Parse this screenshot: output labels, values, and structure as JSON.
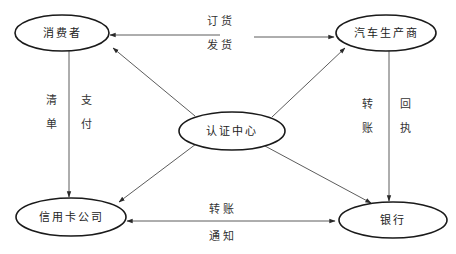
{
  "diagram": {
    "nodes": [
      {
        "id": "consumer",
        "label": "消费者",
        "cx": 62,
        "cy": 33,
        "rx": 47,
        "ry": 18
      },
      {
        "id": "manufacturer",
        "label": "汽车生产商",
        "cx": 386,
        "cy": 33,
        "rx": 50,
        "ry": 18
      },
      {
        "id": "cert_center",
        "label": "认证中心",
        "cx": 232,
        "cy": 131,
        "rx": 53,
        "ry": 19
      },
      {
        "id": "credit_card_co",
        "label": "信用卡公司",
        "cx": 71,
        "cy": 217,
        "rx": 55,
        "ry": 19
      },
      {
        "id": "bank",
        "label": "银行",
        "cx": 393,
        "cy": 220,
        "rx": 54,
        "ry": 18
      }
    ],
    "edges": [
      {
        "from": "manufacturer",
        "to": "consumer",
        "x1": 220,
        "y1": 35,
        "x2": 110,
        "y2": 35,
        "arrow": "end",
        "labels": [
          "订货",
          "发货"
        ]
      },
      {
        "from": "consumer",
        "to": "manufacturer",
        "x1": 254,
        "y1": 37,
        "x2": 334,
        "y2": 37,
        "arrow": "end"
      },
      {
        "from": "consumer",
        "to": "credit_card_co",
        "x1": 69,
        "y1": 51,
        "x2": 69,
        "y2": 197,
        "arrow": "end",
        "labels": [
          "清单",
          "支付"
        ]
      },
      {
        "from": "manufacturer",
        "to": "bank",
        "x1": 389,
        "y1": 51,
        "x2": 389,
        "y2": 201,
        "arrow": "end",
        "labels": [
          "转账",
          "回执"
        ]
      },
      {
        "from": "bank",
        "to": "credit_card_co",
        "x1": 335,
        "y1": 221,
        "x2": 127,
        "y2": 221,
        "arrow": "both",
        "labels": [
          "转账",
          "通知"
        ]
      },
      {
        "from": "cert_center",
        "to": "consumer",
        "x1": 195,
        "y1": 116,
        "x2": 113,
        "y2": 48,
        "arrow": "end"
      },
      {
        "from": "cert_center",
        "to": "manufacturer",
        "x1": 272,
        "y1": 117,
        "x2": 345,
        "y2": 48,
        "arrow": "end"
      },
      {
        "from": "cert_center",
        "to": "credit_card_co",
        "x1": 196,
        "y1": 144,
        "x2": 119,
        "y2": 202,
        "arrow": "end"
      },
      {
        "from": "cert_center",
        "to": "bank",
        "x1": 265,
        "y1": 146,
        "x2": 371,
        "y2": 203,
        "arrow": "end"
      }
    ],
    "edge_labels": [
      {
        "text": "订货",
        "x": 221,
        "y": 25
      },
      {
        "text": "发货",
        "x": 221,
        "y": 49
      },
      {
        "text": "清单",
        "vertical": true,
        "x": 53,
        "y": 104
      },
      {
        "text": "支付",
        "vertical": true,
        "x": 88,
        "y": 104
      },
      {
        "text": "转账",
        "vertical": true,
        "x": 369,
        "y": 108
      },
      {
        "text": "回执",
        "vertical": true,
        "x": 407,
        "y": 108
      },
      {
        "text": "转账",
        "x": 223,
        "y": 213
      },
      {
        "text": "通知",
        "x": 223,
        "y": 240
      }
    ],
    "colors": {
      "line": "#4a4a4a",
      "ellipse_stroke": "#1a1a1a",
      "text": "#222222",
      "background": "#ffffff"
    }
  }
}
